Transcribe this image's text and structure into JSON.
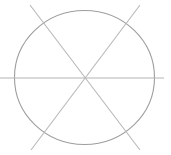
{
  "canvas": {
    "width": 171,
    "height": 155,
    "background_color": "#ffffff",
    "title": "Circle with three crossing chords"
  },
  "palette": {
    "circle_stroke": "#9e9e9e",
    "line_stroke": "#b3b3b3",
    "diagonal_stroke": "#b8b8b8",
    "background": "#ffffff"
  },
  "figure": {
    "type": "line-drawing",
    "shapes": [
      {
        "name": "circle-outline",
        "kind": "ellipse",
        "cx": 84.5,
        "cy": 77.5,
        "rx": 70.0,
        "ry": 67.0,
        "stroke": "#9e9e9e",
        "stroke_width": 1.1,
        "fill": "none"
      },
      {
        "name": "horizontal-line",
        "kind": "line",
        "x1": 0.0,
        "y1": 78.0,
        "x2": 164.0,
        "y2": 78.0,
        "stroke": "#b3b3b3",
        "stroke_width": 1.2
      },
      {
        "name": "diagonal-line-nw-se",
        "kind": "line",
        "x1": 30.0,
        "y1": 5.0,
        "x2": 140.0,
        "y2": 150.0,
        "stroke": "#b8b8b8",
        "stroke_width": 1.1
      },
      {
        "name": "diagonal-line-ne-sw",
        "kind": "line",
        "x1": 140.0,
        "y1": 5.0,
        "x2": 31.0,
        "y2": 150.0,
        "stroke": "#b8b8b8",
        "stroke_width": 1.1
      }
    ],
    "intersections": [
      {
        "name": "center-crossing",
        "x": 85.0,
        "y": 78.0
      },
      {
        "name": "upper-left-chord-crossing",
        "x": 43.0,
        "y": 25.0
      },
      {
        "name": "upper-right-chord-crossing",
        "x": 128.0,
        "y": 26.0
      },
      {
        "name": "lower-left-chord-crossing",
        "x": 43.0,
        "y": 131.0
      },
      {
        "name": "lower-right-chord-crossing",
        "x": 127.0,
        "y": 130.0
      }
    ]
  }
}
